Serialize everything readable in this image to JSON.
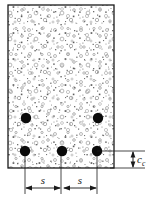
{
  "figure": {
    "kind": "engineering-cross-section",
    "background_color": "#ffffff",
    "line_color": "#1a1a1a",
    "hatch_color": "#8c8c8c",
    "rebar_color": "#0a0a0a"
  },
  "section": {
    "name": "concrete-section-outline",
    "x": 8,
    "y": 5,
    "width": 106,
    "height": 163,
    "fill_pattern": "stipple-dots-and-circles"
  },
  "rebars": {
    "radius": 5.2,
    "upper_row": [
      {
        "name": "rebar-upper-left",
        "cx": 26,
        "cy": 118
      },
      {
        "name": "rebar-upper-right",
        "cx": 98,
        "cy": 118
      }
    ],
    "lower_row": [
      {
        "name": "rebar-lower-left",
        "cx": 25,
        "cy": 151
      },
      {
        "name": "rebar-lower-middle",
        "cx": 62,
        "cy": 151
      },
      {
        "name": "rebar-lower-right",
        "cx": 97,
        "cy": 151
      }
    ]
  },
  "dimensions": {
    "spacing": {
      "label": "s",
      "segments": [
        {
          "name": "spacing-dimension-left",
          "label": "s",
          "x1": 25,
          "x2": 61,
          "y": 188
        },
        {
          "name": "spacing-dimension-right",
          "label": "s",
          "x1": 63,
          "x2": 97,
          "y": 188
        }
      ],
      "extension_lines_y1": 151,
      "extension_lines_y2": 194
    },
    "cover": {
      "label": "c",
      "subscript": "c",
      "name": "clear-cover-dimension",
      "x": 133,
      "y1": 151,
      "y2": 168,
      "leader_top_y": 151,
      "leader_bottom_y": 168,
      "leader_x1": 97,
      "leader_x2": 143,
      "text_x": 137,
      "text_y": 163
    }
  }
}
